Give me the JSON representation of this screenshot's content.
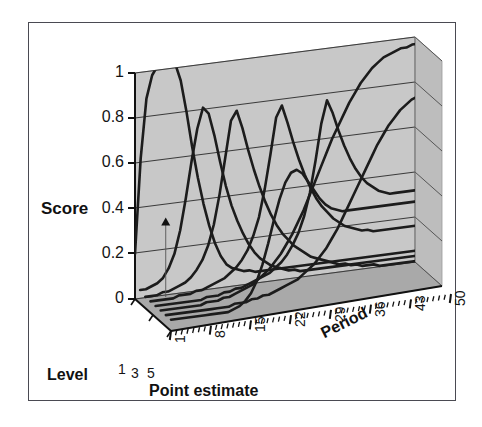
{
  "figure": {
    "kind": "3d-line-chart",
    "border_color": "#4a4a52",
    "background": "#ffffff",
    "wall_color": "#c8c8c8",
    "wall_side_color": "#bdbdbd",
    "floor_color": "#a8a8a8",
    "grid_color": "#3a3a3a",
    "curve_color": "#1c1c1c",
    "axis_color": "#111111"
  },
  "chart_data": {
    "type": "line",
    "projection": "3d",
    "title": "",
    "xlabel": "Point estimate",
    "ylabel": "Score",
    "zlabel": "Period",
    "depth_label": "Level",
    "ylim": [
      0,
      1.08
    ],
    "grid": true,
    "legend": false,
    "axes": {
      "score": {
        "label": "Score",
        "ticks": [
          "0",
          "0.2",
          "0.4",
          "0.6",
          "0.8",
          "1"
        ],
        "values": [
          0,
          0.2,
          0.4,
          0.6,
          0.8,
          1
        ],
        "range": [
          0,
          1
        ]
      },
      "period": {
        "label": "Period",
        "ticks": [
          "1",
          "8",
          "15",
          "22",
          "29",
          "36",
          "43",
          "50"
        ],
        "values": [
          1,
          8,
          15,
          22,
          29,
          36,
          43,
          50
        ],
        "range": [
          1,
          50
        ],
        "minor_tick_step": 1
      },
      "level": {
        "label": "Level",
        "ticks": [
          "1",
          "3",
          "5"
        ],
        "values": [
          1,
          3,
          5
        ],
        "range": [
          1,
          5
        ]
      },
      "point_estimate": {
        "label": "Point estimate"
      }
    },
    "marker": {
      "name": "point-estimate-marker",
      "shape": "triangle",
      "period": 6,
      "score": 0.33
    },
    "series": [
      {
        "name": "level-1",
        "level": 1,
        "x": [
          1,
          2,
          3,
          4,
          5,
          6,
          7,
          8,
          9,
          10,
          11,
          12,
          13,
          14,
          15,
          16,
          17,
          18,
          19,
          20,
          21,
          22,
          23,
          24,
          25,
          26,
          27,
          28,
          29,
          30,
          31,
          32,
          33,
          34,
          35,
          36,
          37,
          38,
          39,
          40,
          41,
          42,
          43,
          44,
          45,
          46,
          47,
          48,
          49,
          50
        ],
        "values": [
          0.2,
          0.62,
          0.88,
          0.98,
          1.02,
          1.03,
          1.03,
          1.02,
          0.94,
          0.8,
          0.64,
          0.5,
          0.38,
          0.28,
          0.2,
          0.14,
          0.1,
          0.08,
          0.07,
          0.06,
          0.06,
          0.05,
          0.05,
          0.05,
          0.05,
          0.05,
          0.05,
          0.05,
          0.05,
          0.05,
          0.05,
          0.05,
          0.05,
          0.05,
          0.05,
          0.05,
          0.05,
          0.05,
          0.05,
          0.05,
          0.05,
          0.05,
          0.05,
          0.05,
          0.05,
          0.05,
          0.05,
          0.05,
          0.05,
          0.05
        ]
      },
      {
        "name": "level-2",
        "level": 2,
        "values": [
          0.06,
          0.06,
          0.07,
          0.08,
          0.1,
          0.14,
          0.2,
          0.3,
          0.44,
          0.6,
          0.74,
          0.83,
          0.8,
          0.7,
          0.58,
          0.47,
          0.38,
          0.31,
          0.25,
          0.2,
          0.16,
          0.13,
          0.11,
          0.09,
          0.08,
          0.07,
          0.06,
          0.06,
          0.05,
          0.05,
          0.05,
          0.05,
          0.05,
          0.05,
          0.05,
          0.05,
          0.05,
          0.05,
          0.05,
          0.05,
          0.05,
          0.05,
          0.05,
          0.05,
          0.05,
          0.05,
          0.05,
          0.05,
          0.05,
          0.05
        ]
      },
      {
        "name": "level-3",
        "level": 3,
        "values": [
          0.05,
          0.05,
          0.05,
          0.06,
          0.06,
          0.07,
          0.08,
          0.09,
          0.11,
          0.14,
          0.18,
          0.24,
          0.33,
          0.46,
          0.62,
          0.78,
          0.82,
          0.74,
          0.64,
          0.55,
          0.47,
          0.4,
          0.34,
          0.29,
          0.25,
          0.22,
          0.19,
          0.17,
          0.15,
          0.13,
          0.12,
          0.11,
          0.1,
          0.09,
          0.08,
          0.08,
          0.07,
          0.07,
          0.06,
          0.06,
          0.06,
          0.05,
          0.05,
          0.05,
          0.05,
          0.05,
          0.05,
          0.05,
          0.05,
          0.05
        ]
      },
      {
        "name": "level-4",
        "level": 4,
        "values": [
          0.05,
          0.05,
          0.05,
          0.05,
          0.05,
          0.06,
          0.06,
          0.06,
          0.07,
          0.07,
          0.08,
          0.09,
          0.1,
          0.11,
          0.13,
          0.15,
          0.18,
          0.22,
          0.28,
          0.36,
          0.48,
          0.63,
          0.79,
          0.84,
          0.76,
          0.67,
          0.59,
          0.52,
          0.46,
          0.41,
          0.37,
          0.34,
          0.31,
          0.29,
          0.27,
          0.26,
          0.25,
          0.24,
          0.24,
          0.23,
          0.23,
          0.23,
          0.23,
          0.23,
          0.23,
          0.23,
          0.23,
          0.23,
          0.23,
          0.23
        ]
      },
      {
        "name": "level-5",
        "level": 5,
        "values": [
          0.05,
          0.05,
          0.05,
          0.05,
          0.05,
          0.05,
          0.05,
          0.05,
          0.05,
          0.06,
          0.06,
          0.06,
          0.07,
          0.07,
          0.08,
          0.08,
          0.09,
          0.1,
          0.11,
          0.12,
          0.13,
          0.15,
          0.17,
          0.2,
          0.24,
          0.29,
          0.36,
          0.46,
          0.6,
          0.76,
          0.86,
          0.8,
          0.72,
          0.65,
          0.59,
          0.54,
          0.5,
          0.47,
          0.45,
          0.43,
          0.42,
          0.41,
          0.41,
          0.41,
          0.41,
          0.41,
          0.41,
          0.41,
          0.41,
          0.41
        ]
      },
      {
        "name": "level-6-rising",
        "level": 6,
        "values": [
          0.05,
          0.05,
          0.05,
          0.05,
          0.05,
          0.05,
          0.05,
          0.05,
          0.06,
          0.06,
          0.06,
          0.07,
          0.07,
          0.08,
          0.09,
          0.1,
          0.11,
          0.13,
          0.15,
          0.17,
          0.2,
          0.23,
          0.27,
          0.31,
          0.36,
          0.41,
          0.47,
          0.53,
          0.59,
          0.65,
          0.71,
          0.76,
          0.81,
          0.86,
          0.9,
          0.94,
          0.97,
          1.0,
          1.02,
          1.04,
          1.05,
          1.06,
          1.07,
          1.07,
          1.08,
          1.08,
          1.08,
          1.08,
          1.08,
          1.08
        ]
      },
      {
        "name": "level-7-rising-late",
        "level": 7,
        "values": [
          0.05,
          0.05,
          0.05,
          0.05,
          0.05,
          0.05,
          0.05,
          0.05,
          0.05,
          0.05,
          0.05,
          0.05,
          0.06,
          0.06,
          0.06,
          0.07,
          0.07,
          0.08,
          0.08,
          0.09,
          0.1,
          0.11,
          0.12,
          0.13,
          0.15,
          0.17,
          0.19,
          0.22,
          0.25,
          0.29,
          0.33,
          0.38,
          0.43,
          0.48,
          0.53,
          0.58,
          0.63,
          0.68,
          0.72,
          0.76,
          0.79,
          0.82,
          0.84,
          0.86,
          0.87,
          0.88,
          0.88,
          0.88,
          0.88,
          0.88
        ]
      },
      {
        "name": "level-8-decaying",
        "level": 8,
        "values": [
          0.05,
          0.05,
          0.05,
          0.05,
          0.05,
          0.05,
          0.05,
          0.05,
          0.05,
          0.05,
          0.05,
          0.06,
          0.07,
          0.09,
          0.12,
          0.17,
          0.24,
          0.33,
          0.43,
          0.52,
          0.59,
          0.63,
          0.64,
          0.62,
          0.58,
          0.54,
          0.5,
          0.47,
          0.45,
          0.44,
          0.43,
          0.43,
          0.43,
          0.43,
          0.43,
          0.43,
          0.43,
          0.43,
          0.43,
          0.43,
          0.43,
          0.43,
          0.43,
          0.43,
          0.43,
          0.43,
          0.43,
          0.43,
          0.43,
          0.43
        ]
      }
    ]
  },
  "labels": {
    "score": "Score",
    "period": "Period",
    "level": "Level",
    "point_estimate": "Point estimate"
  }
}
